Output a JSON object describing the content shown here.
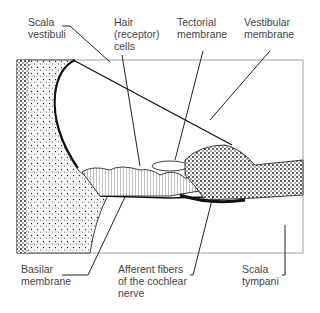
{
  "diagram": {
    "labels": {
      "scala_vestibuli": "Scala\nvestibuli",
      "hair_cells": "Hair\n(receptor)\ncells",
      "tectorial_membrane": "Tectorial\nmembrane",
      "vestibular_membrane": "Vestibular\nmembrane",
      "basilar_membrane": "Basilar\nmembrane",
      "afferent_fibers": "Afferent fibers\nof the cochlear\nnerve",
      "scala_tympani": "Scala\ntympani"
    }
  }
}
